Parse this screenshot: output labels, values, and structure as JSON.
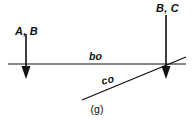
{
  "figure": {
    "caption": "(g)",
    "background_color": "#ffffff",
    "ink_color": "#101010",
    "labels": {
      "left_vector": "A, B",
      "right_vector": "B, C",
      "horizontal_line": "bo",
      "diagonal_line": "co"
    },
    "geometry": {
      "horizontal_line": {
        "x1": 8,
        "y1": 64,
        "x2": 186,
        "y2": 64
      },
      "diagonal_line": {
        "x1": 82,
        "y1": 100,
        "x2": 186,
        "y2": 57
      },
      "left_arrow": {
        "x": 26,
        "y_start": 34,
        "y_end": 78,
        "direction": "down"
      },
      "right_arrow": {
        "x": 166,
        "y_start": 15,
        "y_end": 78,
        "direction": "down"
      }
    }
  }
}
